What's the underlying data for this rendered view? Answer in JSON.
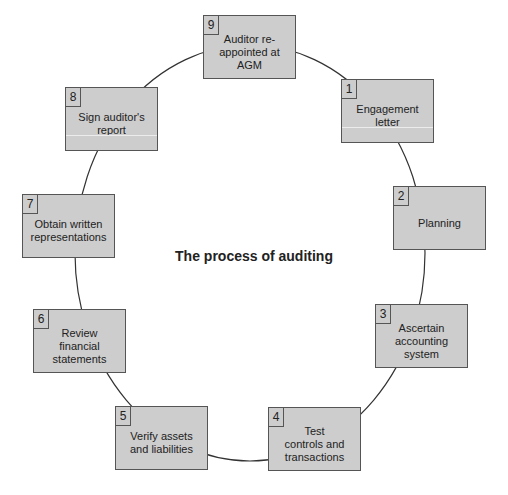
{
  "title": "The process of auditing",
  "colors": {
    "box_fill": "#cdcdcd",
    "box_border": "#555555",
    "line": "#333333",
    "text": "#222222"
  },
  "cycle": {
    "shape": "ellipse",
    "cx": 250,
    "cy": 253,
    "rx": 175,
    "ry": 208
  },
  "steps": [
    {
      "num": "1",
      "label": "Engagement\nletter",
      "x": 341,
      "y": 79
    },
    {
      "num": "2",
      "label": "Planning",
      "x": 393,
      "y": 186
    },
    {
      "num": "3",
      "label": "Ascertain\naccounting\nsystem",
      "x": 375,
      "y": 304
    },
    {
      "num": "4",
      "label": "Test\ncontrols and\ntransactions",
      "x": 268,
      "y": 407
    },
    {
      "num": "5",
      "label": "Verify assets\nand liabilities",
      "x": 115,
      "y": 406
    },
    {
      "num": "6",
      "label": "Review\nfinancial\nstatements",
      "x": 33,
      "y": 309
    },
    {
      "num": "7",
      "label": "Obtain written\nrepresentations",
      "x": 22,
      "y": 194
    },
    {
      "num": "8",
      "label": "Sign auditor's\nreport",
      "x": 65,
      "y": 87
    },
    {
      "num": "9",
      "label": "Auditor re-\nappointed at\nAGM",
      "x": 203,
      "y": 15
    }
  ]
}
